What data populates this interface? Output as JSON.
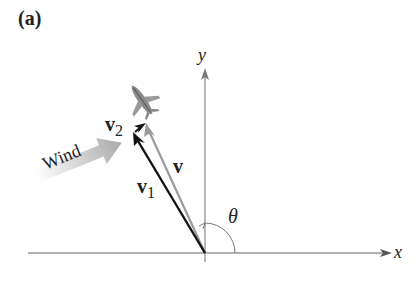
{
  "panel_label": "(a)",
  "axes": {
    "x_label": "x",
    "y_label": "y"
  },
  "vectors": {
    "v1": {
      "name": "v",
      "sub": "1",
      "color": "#111111"
    },
    "v": {
      "name": "v",
      "color": "#9a9a9a"
    },
    "v2": {
      "name": "v",
      "sub": "2",
      "color": "#111111"
    }
  },
  "angle_label": "θ",
  "wind_label": "Wind",
  "colors": {
    "axis": "#666666",
    "wind_arrow": "#b5b5b5"
  }
}
